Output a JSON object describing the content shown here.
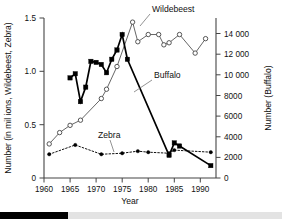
{
  "chart_data": {
    "type": "line",
    "title": "",
    "xlabel": "Year",
    "ylabel_left": "Number (in mil ions, Wildebeest, Zebra)",
    "ylabel_right": "Number (Buffalo)",
    "xlim": [
      1960,
      1993
    ],
    "ylim_left": [
      0,
      1.55
    ],
    "ylim_right": [
      0,
      15500
    ],
    "grid": false,
    "legend_position": "inline-annotations",
    "x_ticks": [
      1960,
      1965,
      1970,
      1975,
      1980,
      1985,
      1990
    ],
    "x_ticklabels": [
      "1960",
      "1965",
      "1970",
      "1975",
      "1980",
      "1985",
      "1990"
    ],
    "y_ticks_left": [
      0,
      0.5,
      1.0,
      1.5
    ],
    "y_ticklabels_left": [
      "0",
      "0.5",
      "1.0",
      "1.5"
    ],
    "y_ticks_right": [
      0,
      2000,
      4000,
      6000,
      8000,
      10000,
      12000,
      14000
    ],
    "y_ticklabels_right": [
      "0",
      "2000",
      "4000",
      "6000",
      "8000",
      "10 000",
      "12 000",
      "14 000"
    ],
    "series": [
      {
        "name": "Wildebeest",
        "axis": "left",
        "units": "millions",
        "marker": "open-circle",
        "linestyle": "solid",
        "x": [
          1961,
          1963,
          1965,
          1967,
          1971,
          1972,
          1974,
          1977,
          1978,
          1980,
          1982,
          1983,
          1984,
          1986,
          1989,
          1991
        ],
        "values": [
          0.33,
          0.44,
          0.51,
          0.56,
          0.77,
          0.86,
          1.08,
          1.51,
          1.32,
          1.39,
          1.39,
          1.29,
          1.31,
          1.39,
          1.21,
          1.35
        ]
      },
      {
        "name": "Buffalo",
        "axis": "right",
        "units": "head",
        "marker": "filled-square",
        "linestyle": "solid",
        "x": [
          1965,
          1966,
          1967,
          1968,
          1969,
          1970,
          1971,
          1972,
          1973,
          1974,
          1975,
          1976,
          1984,
          1985,
          1986,
          1992
        ],
        "values": [
          9700,
          10100,
          7400,
          8800,
          11300,
          11200,
          11000,
          10200,
          11500,
          12400,
          13900,
          11500,
          2200,
          3400,
          3100,
          1200
        ]
      },
      {
        "name": "Zebra",
        "axis": "left",
        "units": "millions",
        "marker": "filled-circle",
        "linestyle": "dotted",
        "x": [
          1961,
          1966,
          1971,
          1975,
          1978,
          1980,
          1984,
          1985,
          1992
        ],
        "values": [
          0.23,
          0.32,
          0.23,
          0.24,
          0.26,
          0.25,
          0.24,
          0.27,
          0.25
        ]
      }
    ],
    "annotations": [
      {
        "text": "Wildebeest",
        "points_to_series": "Wildebeest"
      },
      {
        "text": "Buffalo",
        "points_to_series": "Buffalo"
      },
      {
        "text": "Zebra",
        "points_to_series": "Zebra"
      }
    ]
  },
  "scrollbar": {
    "position_percent": 24
  }
}
